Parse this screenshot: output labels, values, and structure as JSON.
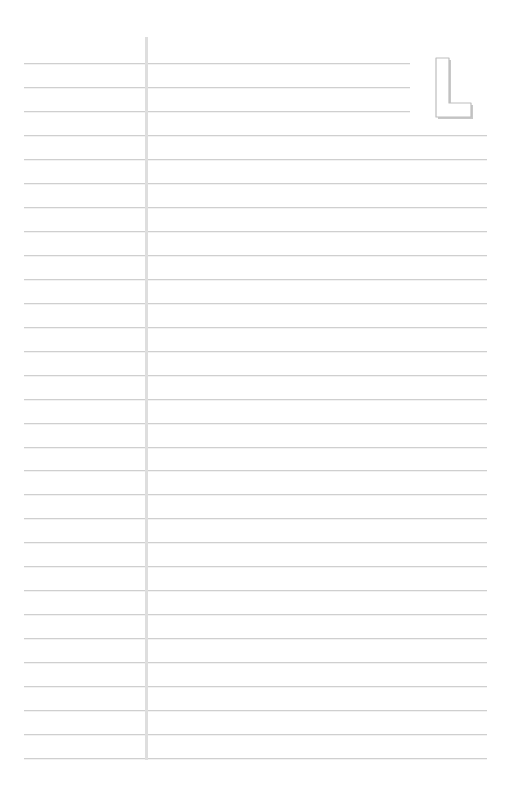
{
  "page": {
    "type": "lined-notebook-page",
    "background_color": "#ffffff",
    "rule_color": "#cfcfcf",
    "margin_color": "#dedede",
    "letter": "L",
    "rules": {
      "count": 30,
      "first_y": 63,
      "spacing": 23.97,
      "left_x": 24,
      "right_x": 487,
      "short_right_x": 410,
      "short_count": 3
    },
    "margin_line": {
      "x": 146,
      "top": 37,
      "bottom": 760
    }
  }
}
